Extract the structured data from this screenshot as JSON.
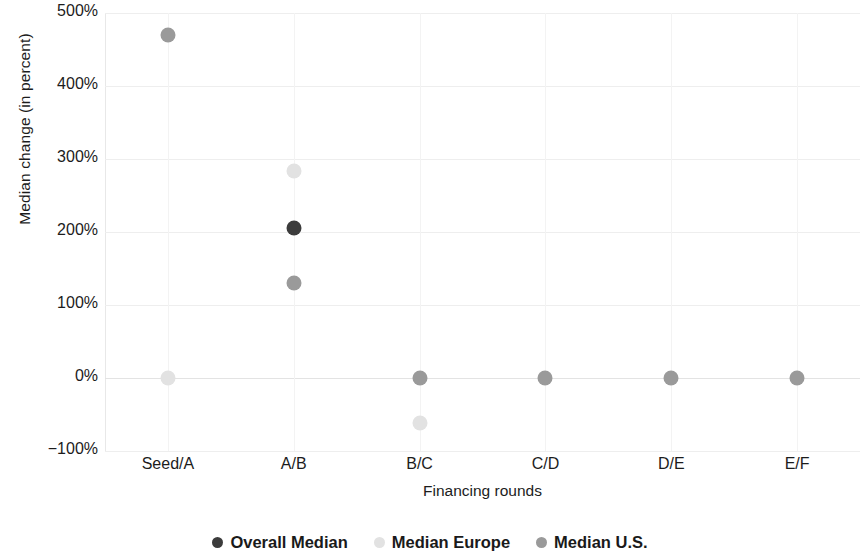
{
  "chart_data": {
    "type": "scatter",
    "title": "",
    "xlabel": "Financing rounds",
    "ylabel": "Median change (in percent)",
    "categories": [
      "Seed/A",
      "A/B",
      "B/C",
      "C/D",
      "D/E",
      "E/F"
    ],
    "ylim": [
      -100,
      500
    ],
    "ytick_labels": [
      "500%",
      "400%",
      "300%",
      "200%",
      "100%",
      "0%",
      "−100%"
    ],
    "ytick_values": [
      500,
      400,
      300,
      200,
      100,
      0,
      -100
    ],
    "grid": true,
    "legend_position": "bottom",
    "series": [
      {
        "name": "Overall Median",
        "color": "#3c3c3c",
        "values": [
          null,
          205,
          null,
          null,
          null,
          null
        ]
      },
      {
        "name": "Median Europe",
        "color": "#e2e2e2",
        "values": [
          0,
          283,
          -62,
          null,
          null,
          null
        ]
      },
      {
        "name": "Median U.S.",
        "color": "#9a9a9a",
        "values": [
          470,
          130,
          0,
          0,
          0,
          0
        ]
      }
    ]
  },
  "legend": {
    "items": [
      {
        "label": "Overall Median",
        "color": "#3c3c3c"
      },
      {
        "label": "Median Europe",
        "color": "#e2e2e2"
      },
      {
        "label": "Median U.S.",
        "color": "#9a9a9a"
      }
    ]
  },
  "axes": {
    "y_title": "Median change (in percent)",
    "x_title": "Financing rounds"
  }
}
